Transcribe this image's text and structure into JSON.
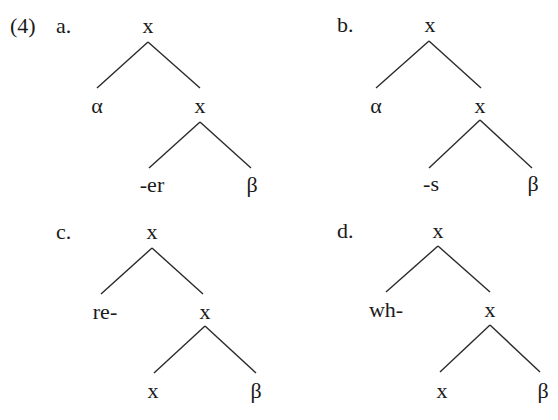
{
  "example_number": "(4)",
  "trees": [
    {
      "id": "a",
      "label": "a.",
      "root": "x",
      "left": "α",
      "right": "x",
      "right_left": "-er",
      "right_right": "β"
    },
    {
      "id": "b",
      "label": "b.",
      "root": "x",
      "left": "α",
      "right": "x",
      "right_left": "-s",
      "right_right": "β"
    },
    {
      "id": "c",
      "label": "c.",
      "root": "x",
      "left": "re-",
      "right": "x",
      "right_left": "x",
      "right_right": "β"
    },
    {
      "id": "d",
      "label": "d.",
      "root": "x",
      "left": "wh-",
      "right": "x",
      "right_left": "x",
      "right_right": "β"
    }
  ]
}
